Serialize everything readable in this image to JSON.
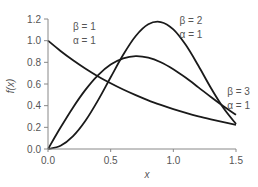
{
  "chart_data": {
    "type": "line",
    "title": "",
    "xlabel": "x",
    "ylabel": "f(x)",
    "xlim": [
      0,
      1.5
    ],
    "ylim": [
      0,
      1.2
    ],
    "grid": false,
    "xticks": [
      "0.0",
      "0.5",
      "1.0",
      "1.5"
    ],
    "yticks": [
      "0.0",
      "0.2",
      "0.4",
      "0.6",
      "0.8",
      "1.0",
      "1.2"
    ],
    "x": [
      0,
      0.1,
      0.2,
      0.3,
      0.4,
      0.5,
      0.6,
      0.7,
      0.8,
      0.9,
      1.0,
      1.1,
      1.2,
      1.3,
      1.4,
      1.5
    ],
    "series": [
      {
        "name": "β = 1, α = 1",
        "values": [
          1.0,
          0.905,
          0.819,
          0.741,
          0.67,
          0.607,
          0.549,
          0.497,
          0.449,
          0.407,
          0.368,
          0.333,
          0.301,
          0.273,
          0.247,
          0.223
        ]
      },
      {
        "name": "β = 2, α = 1",
        "values": [
          0.0,
          0.198,
          0.384,
          0.548,
          0.682,
          0.779,
          0.837,
          0.858,
          0.844,
          0.801,
          0.736,
          0.657,
          0.569,
          0.48,
          0.394,
          0.316
        ]
      },
      {
        "name": "β = 3, α = 1",
        "values": [
          0.0,
          0.03,
          0.119,
          0.263,
          0.451,
          0.662,
          0.87,
          1.043,
          1.151,
          1.172,
          1.104,
          0.959,
          0.768,
          0.563,
          0.378,
          0.231
        ]
      }
    ],
    "annotations": [
      {
        "line1": "β = 1",
        "line2": "α = 1",
        "x": 0.2,
        "y": 1.1
      },
      {
        "line1": "β = 2",
        "line2": "α = 1",
        "x": 1.05,
        "y": 1.15
      },
      {
        "line1": "β = 3",
        "line2": "α = 1",
        "x": 1.43,
        "y": 0.5
      }
    ]
  }
}
